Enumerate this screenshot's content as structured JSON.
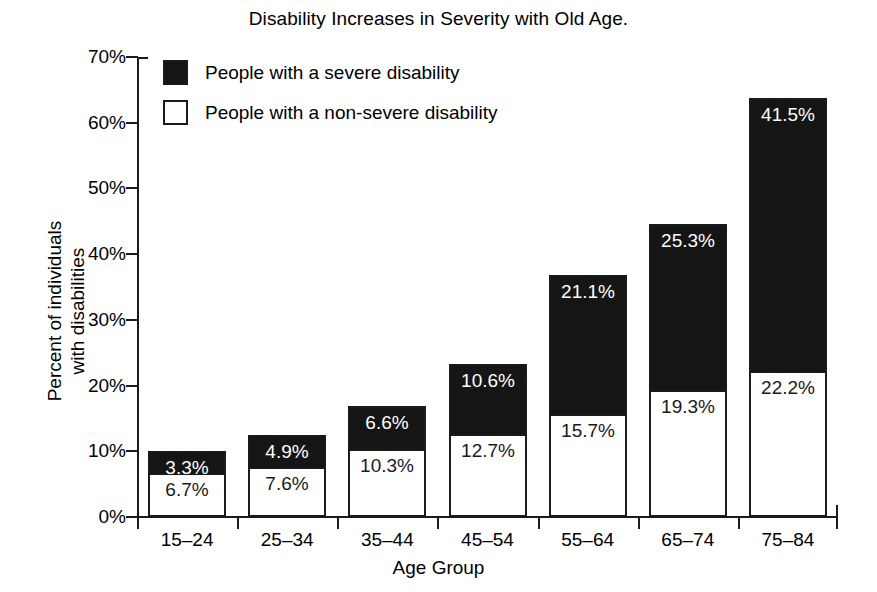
{
  "chart_data": {
    "type": "bar",
    "subtype": "stacked-vertical",
    "title": "Disability Increases in Severity with Old Age.",
    "xlabel": "Age Group",
    "ylabel": "Percent of individuals with disabilities",
    "ylabel_lines": [
      "Percent of individuals",
      "with disabilities"
    ],
    "categories": [
      "15–24",
      "25–34",
      "35–44",
      "45–54",
      "55–64",
      "65–74",
      "75–84"
    ],
    "ylim": [
      0,
      70
    ],
    "ytick_values": [
      0,
      10,
      20,
      30,
      40,
      50,
      60,
      70
    ],
    "ytick_labels": [
      "0%",
      "10%",
      "20%",
      "30%",
      "40%",
      "50%",
      "60%",
      "70%"
    ],
    "grid": false,
    "legend_position": "top-left-inside",
    "series": [
      {
        "name": "People with a non-severe disability",
        "color": "#ffffff",
        "stack_order": 0,
        "values": [
          6.7,
          7.6,
          10.3,
          12.7,
          15.7,
          19.3,
          22.2
        ],
        "labels": [
          "6.7%",
          "7.6%",
          "10.3%",
          "12.7%",
          "15.7%",
          "19.3%",
          "22.2%"
        ]
      },
      {
        "name": "People with a severe disability",
        "color": "#151515",
        "stack_order": 1,
        "values": [
          3.3,
          4.9,
          6.6,
          10.6,
          21.1,
          25.3,
          41.5
        ],
        "labels": [
          "3.3%",
          "4.9%",
          "6.6%",
          "10.6%",
          "21.1%",
          "25.3%",
          "41.5%"
        ]
      }
    ],
    "totals": [
      10.0,
      12.5,
      16.9,
      23.3,
      36.8,
      44.6,
      63.7
    ]
  },
  "legend": {
    "items": [
      {
        "label": "People with a severe disability",
        "swatch": "filled"
      },
      {
        "label": "People with a non-severe disability",
        "swatch": "open"
      }
    ]
  },
  "colors": {
    "severe": "#151515",
    "non_severe": "#ffffff",
    "axis": "#1a1a1a",
    "background": "#ffffff"
  }
}
